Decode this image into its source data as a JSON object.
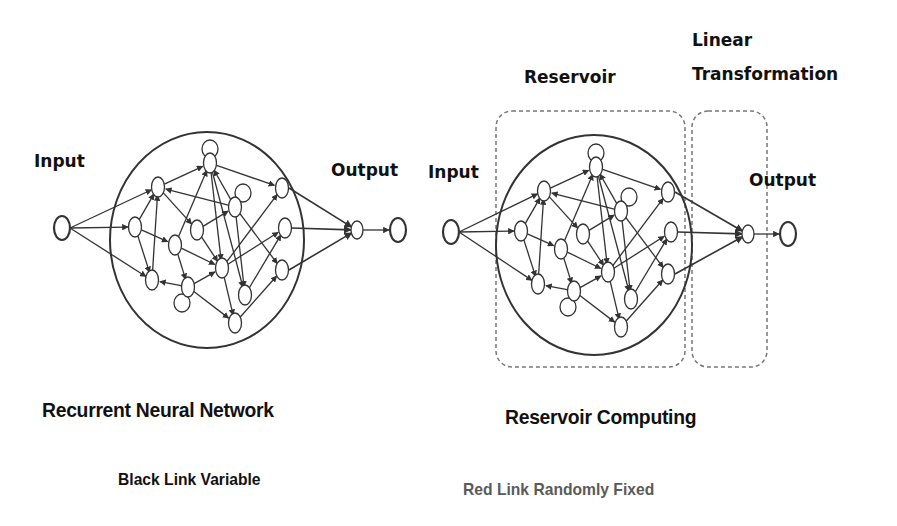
{
  "left_diagram": {
    "input_label": "Input",
    "output_label": "Output",
    "title": "Recurrent Neural Network",
    "subtitle": "Black Link Variable"
  },
  "right_diagram": {
    "input_label": "Input",
    "output_label": "Output",
    "reservoir_label": "Reservoir",
    "linear_label_line1": "Linear",
    "linear_label_line2": "Transformation",
    "title": "Reservoir Computing",
    "subtitle": "Red Link Randomly Fixed"
  },
  "colors": {
    "line": "#333333",
    "dashed_box": "#777777",
    "subtitle_right": "#5a5a5a"
  }
}
